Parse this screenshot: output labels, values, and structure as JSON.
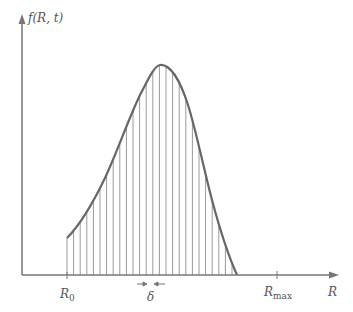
{
  "figure": {
    "y_axis_label": "f(R, t)",
    "x_axis_label": "R",
    "tick_labels": {
      "r0": "R",
      "r0_sub": "0",
      "rmax": "R",
      "rmax_sub": "max"
    },
    "delta_label": "δ",
    "colors": {
      "axis": "#777777",
      "curve": "#666666",
      "strip": "#999999"
    }
  },
  "chart_data": {
    "type": "area",
    "title": "",
    "xlabel": "R",
    "ylabel": "f(R, t)",
    "annotations": [
      "R0",
      "δ",
      "Rmax"
    ],
    "grid": false
  }
}
